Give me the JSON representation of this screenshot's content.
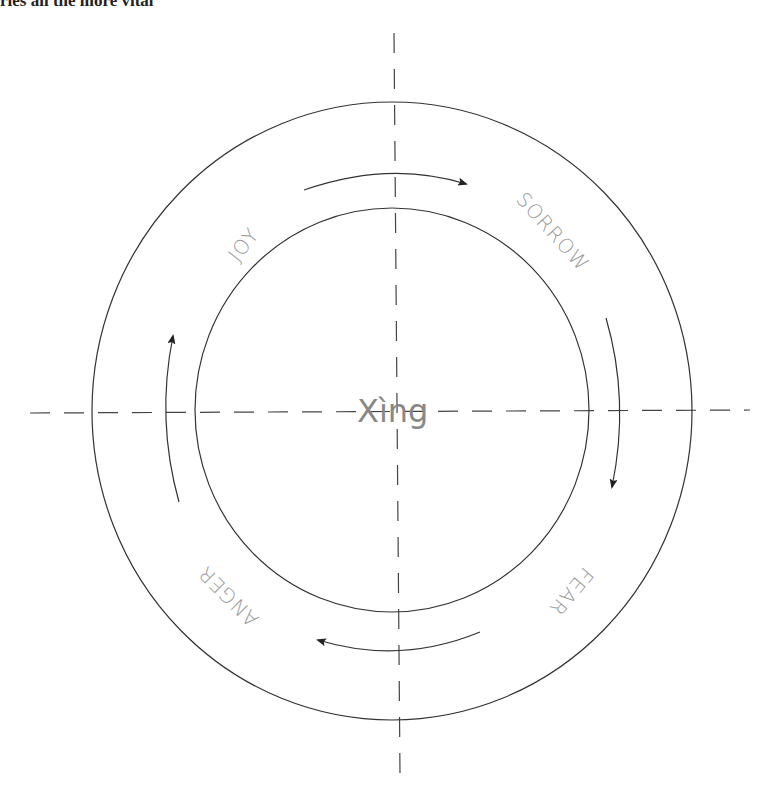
{
  "header_fragment": {
    "text": "ries all the more vital",
    "faint_tail": "..."
  },
  "diagram": {
    "center_label": "Xìng",
    "labels": [
      {
        "id": "joy",
        "text": "JOY"
      },
      {
        "id": "sorrow",
        "text": "SORROW"
      },
      {
        "id": "fear",
        "text": "FEAR"
      },
      {
        "id": "anger",
        "text": "ANGER"
      }
    ],
    "cycle_direction": "clockwise",
    "stroke_color": "#333333",
    "label_color": "#999999"
  }
}
